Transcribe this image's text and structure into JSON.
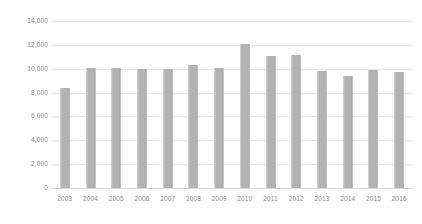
{
  "chart_data": {
    "type": "bar",
    "title": "",
    "subtitle": "",
    "xlabel": "",
    "ylabel": "",
    "categories": [
      "2003",
      "2004",
      "2005",
      "2006",
      "2007",
      "2008",
      "2009",
      "2010",
      "2011",
      "2012",
      "2013",
      "2014",
      "2015",
      "2016"
    ],
    "values": [
      8400,
      10050,
      10100,
      9950,
      9950,
      10300,
      10050,
      12050,
      11050,
      11150,
      9800,
      9400,
      9900,
      9700
    ],
    "series": [
      {
        "name": "",
        "values": [
          8400,
          10050,
          10100,
          9950,
          9950,
          10300,
          10050,
          12050,
          11050,
          11150,
          9800,
          9400,
          9900,
          9700
        ]
      }
    ],
    "ylim": [
      0,
      14000
    ],
    "y_ticks": [
      0,
      2000,
      4000,
      6000,
      8000,
      10000,
      12000,
      14000
    ],
    "y_tick_labels": [
      "0",
      "2,000",
      "4,000",
      "6,000",
      "8,000",
      "10,000",
      "12,000",
      "14,000"
    ],
    "grid": true,
    "grid_axis": "y",
    "legend": false,
    "legend_position": "none",
    "bar_color": "#b3b3b3",
    "grid_color": "#e9e9e9",
    "tick_label_color": "#8c8c8c",
    "background_color": "#ffffff"
  }
}
